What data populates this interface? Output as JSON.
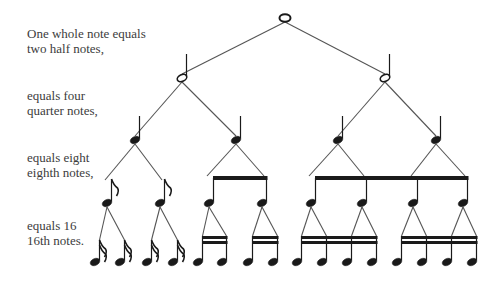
{
  "labels": [
    {
      "id": "whole",
      "text": "One whole note equals\ntwo half notes,",
      "top": 26
    },
    {
      "id": "quarter",
      "text": "equals four\nquarter notes,",
      "top": 88
    },
    {
      "id": "eighth",
      "text": "equals eight\neighth notes,",
      "top": 150
    },
    {
      "id": "sixteenth",
      "text": "equals 16\n16th notes.",
      "top": 218
    }
  ],
  "tree": {
    "whole": {
      "x": 285,
      "y": 18
    },
    "half": [
      {
        "x": 182,
        "y": 78
      },
      {
        "x": 385,
        "y": 78
      }
    ],
    "quarter": [
      {
        "x": 135,
        "y": 140
      },
      {
        "x": 236,
        "y": 140
      },
      {
        "x": 338,
        "y": 140
      },
      {
        "x": 436,
        "y": 140
      }
    ],
    "eighth": [
      {
        "x": 107,
        "y": 203,
        "style": "flag"
      },
      {
        "x": 160,
        "y": 203,
        "style": "flag"
      },
      {
        "x": 209,
        "y": 203,
        "style": "beam"
      },
      {
        "x": 262,
        "y": 203,
        "style": "beam"
      },
      {
        "x": 311,
        "y": 203,
        "style": "beam"
      },
      {
        "x": 362,
        "y": 203,
        "style": "beam"
      },
      {
        "x": 413,
        "y": 203,
        "style": "beam"
      },
      {
        "x": 463,
        "y": 203,
        "style": "beam"
      }
    ],
    "eighth_beams": [
      {
        "x1": 209,
        "x2": 262,
        "y": 178
      },
      {
        "x1": 311,
        "x2": 463,
        "y": 178
      }
    ],
    "sixteenth": [
      {
        "x": 95,
        "y": 262,
        "style": "flag"
      },
      {
        "x": 120,
        "y": 262,
        "style": "flag"
      },
      {
        "x": 147,
        "y": 262,
        "style": "flag"
      },
      {
        "x": 173,
        "y": 262,
        "style": "flag"
      },
      {
        "x": 198,
        "y": 262,
        "style": "beam"
      },
      {
        "x": 222,
        "y": 262,
        "style": "beam"
      },
      {
        "x": 248,
        "y": 262,
        "style": "beam"
      },
      {
        "x": 273,
        "y": 262,
        "style": "beam"
      },
      {
        "x": 297,
        "y": 262,
        "style": "beam"
      },
      {
        "x": 322,
        "y": 262,
        "style": "beam"
      },
      {
        "x": 347,
        "y": 262,
        "style": "beam"
      },
      {
        "x": 372,
        "y": 262,
        "style": "beam"
      },
      {
        "x": 397,
        "y": 262,
        "style": "beam"
      },
      {
        "x": 422,
        "y": 262,
        "style": "beam"
      },
      {
        "x": 447,
        "y": 262,
        "style": "beam"
      },
      {
        "x": 472,
        "y": 262,
        "style": "beam"
      }
    ],
    "sixteenth_beams": [
      {
        "x1": 198,
        "x2": 222,
        "y": 238
      },
      {
        "x1": 248,
        "x2": 273,
        "y": 238
      },
      {
        "x1": 297,
        "x2": 372,
        "y": 238
      },
      {
        "x1": 397,
        "x2": 472,
        "y": 238
      }
    ]
  },
  "colors": {
    "ink": "#1a1a1a",
    "line": "#555555",
    "text": "#3c3c3c"
  }
}
